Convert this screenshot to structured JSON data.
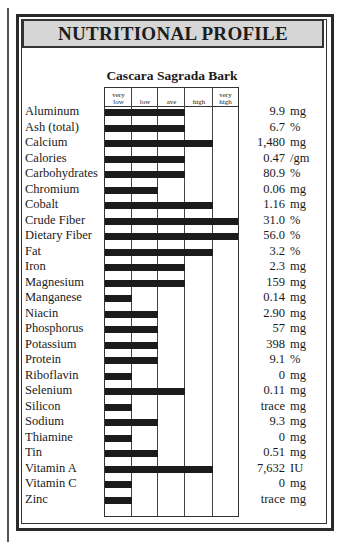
{
  "header": {
    "title": "NUTRITIONAL PROFILE"
  },
  "chart_data": {
    "type": "bar",
    "title": "Cascara Sagrada Bark",
    "scale_levels": [
      "very low",
      "low",
      "ave",
      "high",
      "very high"
    ],
    "scale_header": [
      [
        "very",
        "low"
      ],
      [
        "",
        "low"
      ],
      [
        "",
        "ave"
      ],
      [
        "",
        "high"
      ],
      [
        "very",
        "high"
      ]
    ],
    "xlabel": "",
    "ylabel": "",
    "orientation": "horizontal",
    "categories": [
      "Aluminum",
      "Ash (total)",
      "Calcium",
      "Calories",
      "Carbohydrates",
      "Chromium",
      "Cobalt",
      "Crude Fiber",
      "Dietary Fiber",
      "Fat",
      "Iron",
      "Magnesium",
      "Manganese",
      "Niacin",
      "Phosphorus",
      "Potassium",
      "Protein",
      "Riboflavin",
      "Selenium",
      "Silicon",
      "Sodium",
      "Thiamine",
      "Tin",
      "Vitamin A",
      "Vitamin C",
      "Zinc"
    ],
    "levels": [
      3,
      3,
      4,
      3,
      3,
      2,
      4,
      5,
      5,
      4,
      3,
      3,
      1,
      2,
      2,
      2,
      2,
      1,
      3,
      1,
      2,
      1,
      2,
      4,
      1,
      1
    ],
    "amounts": [
      "9.9",
      "6.7",
      "1,480",
      "0.47",
      "80.9",
      "0.06",
      "1.16",
      "31.0",
      "56.0",
      "3.2",
      "2.3",
      "159",
      "0.14",
      "2.90",
      "57",
      "398",
      "9.1",
      "0",
      "0.11",
      "trace",
      "9.3",
      "0",
      "0.51",
      "7,632",
      "0",
      "trace"
    ],
    "units": [
      "mg",
      "%",
      "mg",
      "/gm",
      "%",
      "mg",
      "mg",
      "%",
      "%",
      "%",
      "mg",
      "mg",
      "mg",
      "mg",
      "mg",
      "mg",
      "%",
      "mg",
      "mg",
      "mg",
      "mg",
      "mg",
      "mg",
      "IU",
      "mg",
      "mg"
    ]
  }
}
